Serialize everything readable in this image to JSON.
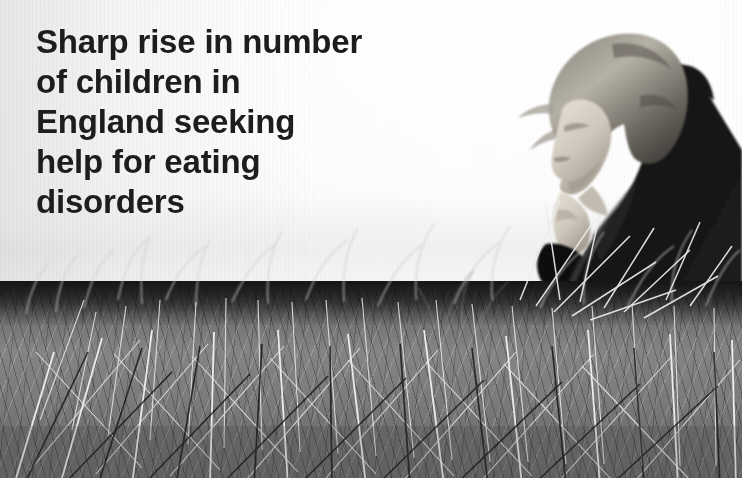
{
  "image": {
    "kind": "news-photograph-with-overlaid-headline",
    "width": 742,
    "height": 485,
    "rendering": "black-and-white / greyscale photograph, slightly soft and scanned",
    "alt": "Black and white photograph of a young person in a dark coat sitting in profile among tall dry grass, hand raised to chin, against a bright hazy sky, with a bold headline overlaid on the left"
  },
  "headline": {
    "full_text": "Sharp rise in number of children in England seeking help for eating disorders",
    "lines": [
      "Sharp rise in number",
      "of children in",
      "England seeking",
      "help for eating",
      "disorders"
    ],
    "color": "#1d1d1d",
    "weight": "bold",
    "alignment": "left"
  },
  "scene": {
    "subject": "young person seated in profile facing left",
    "subject_details": [
      "light blonde windblown hair",
      "dark heavy coat",
      "hand raised near chin",
      "seated low in the grass"
    ],
    "foreground": "tall dry grass and reeds filling the lower half of the frame",
    "background": "blown-out pale sky, low horizon",
    "mood": "sombre, isolated"
  },
  "palette": {
    "sky_white": "#fdfdfd",
    "sky_grey": "#eeeeee",
    "headline_text": "#1d1d1d",
    "grass_mid": "#808080",
    "grass_highlight": "#e8e8e8",
    "figure_dark": "#141414",
    "skin_light": "#d8d2c8"
  },
  "caption": {
    "credit_text": "",
    "visible": false
  }
}
